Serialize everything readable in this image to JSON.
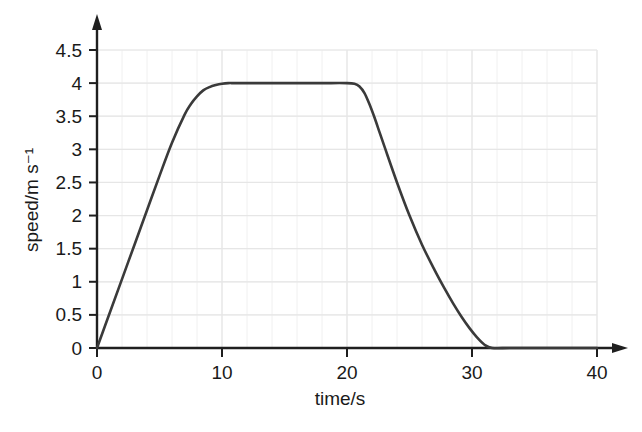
{
  "chart_data": {
    "type": "line",
    "title": "",
    "xlabel": "time/s",
    "ylabel": "speed/m s⁻¹",
    "xlim": [
      0,
      40
    ],
    "ylim": [
      0,
      4.5
    ],
    "grid": true,
    "legend": false,
    "x_ticks": [
      0,
      10,
      20,
      30,
      40
    ],
    "x_tick_labels": [
      "0",
      "10",
      "20",
      "30",
      "40"
    ],
    "y_ticks": [
      0,
      0.5,
      1,
      1.5,
      2,
      2.5,
      3,
      3.5,
      4,
      4.5
    ],
    "y_tick_labels": [
      "0",
      "0.5",
      "1",
      "1.5",
      "2",
      "2.5",
      "3",
      "3.5",
      "4",
      "4.5"
    ],
    "x_minor_step": 2,
    "y_minor_step": 0.5,
    "series": [
      {
        "name": "speed",
        "color": "#3a3a3a",
        "x": [
          0,
          1,
          2,
          3,
          4,
          5,
          6,
          7,
          7.5,
          8,
          8.5,
          9,
          9.5,
          10,
          10.5,
          11,
          12,
          14,
          16,
          18,
          20,
          20.6,
          21,
          21.4,
          21.8,
          22.2,
          22.6,
          23,
          24,
          25,
          26,
          27,
          27.8,
          28.5,
          29.2,
          29.8,
          30.4,
          31,
          31.6,
          33,
          35,
          37,
          40
        ],
        "y": [
          0,
          0.52,
          1.04,
          1.56,
          2.08,
          2.6,
          3.1,
          3.52,
          3.68,
          3.8,
          3.89,
          3.94,
          3.97,
          3.99,
          4.0,
          4.0,
          4.0,
          4.0,
          4.0,
          4.0,
          4.0,
          3.99,
          3.95,
          3.85,
          3.68,
          3.48,
          3.26,
          3.04,
          2.5,
          2.0,
          1.56,
          1.18,
          0.9,
          0.67,
          0.46,
          0.3,
          0.16,
          0.05,
          0.0,
          0.0,
          0.0,
          0.0,
          0.0
        ],
        "description": "Acceleration from 0 to 4 m/s over about 10 s, constant speed 4 m/s until about 21 s, deceleration to rest by about 31 s"
      }
    ],
    "annotations": [],
    "axis_style": {
      "x_axis_arrow": true,
      "y_axis_arrow": true,
      "grid_color": "#e6e6e6",
      "axis_color": "#1f1f1f"
    }
  }
}
